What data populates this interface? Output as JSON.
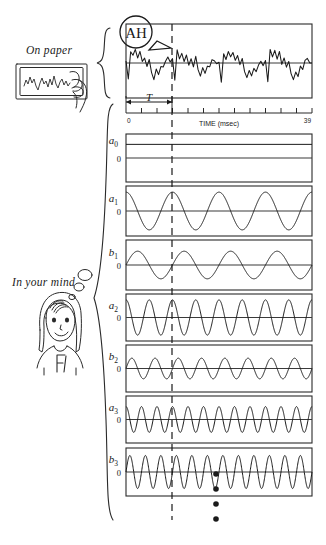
{
  "figure": {
    "annotations": {
      "on_paper": "On paper",
      "in_your_mind": "In your mind",
      "bubble_text": "AH",
      "period_marker": "T",
      "ellipsis_dots": 4
    },
    "axis": {
      "label": "TIME (msec)",
      "tick_start_label": "0",
      "tick_end_label": "39",
      "ticks": 13,
      "range": [
        0,
        39
      ]
    },
    "panels": [
      {
        "label": "a0",
        "label_display": "a",
        "sub": "0",
        "zero_label": "0",
        "type": "dc",
        "cycles": 0,
        "amplitude": 0.0,
        "offset": 0.62,
        "phase": "constant"
      },
      {
        "label": "a1",
        "label_display": "a",
        "sub": "1",
        "zero_label": "0",
        "type": "cosine",
        "cycles": 4,
        "amplitude": 0.82,
        "offset": 0,
        "phase": "cos"
      },
      {
        "label": "b1",
        "label_display": "b",
        "sub": "1",
        "zero_label": "0",
        "type": "sine",
        "cycles": 4,
        "amplitude": 0.6,
        "offset": 0,
        "phase": "sin"
      },
      {
        "label": "a2",
        "label_display": "a",
        "sub": "2",
        "zero_label": "0",
        "type": "cosine",
        "cycles": 8,
        "amplitude": 0.82,
        "offset": 0,
        "phase": "cos"
      },
      {
        "label": "b2",
        "label_display": "b",
        "sub": "2",
        "zero_label": "0",
        "type": "sine",
        "cycles": 8,
        "amplitude": 0.48,
        "offset": 0,
        "phase": "sin"
      },
      {
        "label": "a3",
        "label_display": "a",
        "sub": "3",
        "zero_label": "0",
        "type": "cosine",
        "cycles": 12,
        "amplitude": 0.6,
        "offset": 0,
        "phase": "cos"
      },
      {
        "label": "b3",
        "label_display": "b",
        "sub": "3",
        "zero_label": "0",
        "type": "sine",
        "cycles": 12,
        "amplitude": 0.75,
        "offset": 0,
        "phase": "sin"
      }
    ],
    "waveform": {
      "name": "speech-waveform-AH",
      "periods": 4,
      "samples": [
        0.1,
        -0.95,
        0.55,
        0.3,
        0.62,
        0.18,
        0.48,
        0.05,
        0.35,
        -0.1,
        0.18,
        -0.45,
        -0.7,
        -0.3,
        -0.55,
        -0.25,
        -0.35,
        0.02,
        0.2,
        0.0
      ]
    },
    "colors": {
      "ink": "#1a1a1a",
      "frame": "#2a2a2a",
      "baseline": "#3a3a3a",
      "background": "#ffffff"
    }
  }
}
